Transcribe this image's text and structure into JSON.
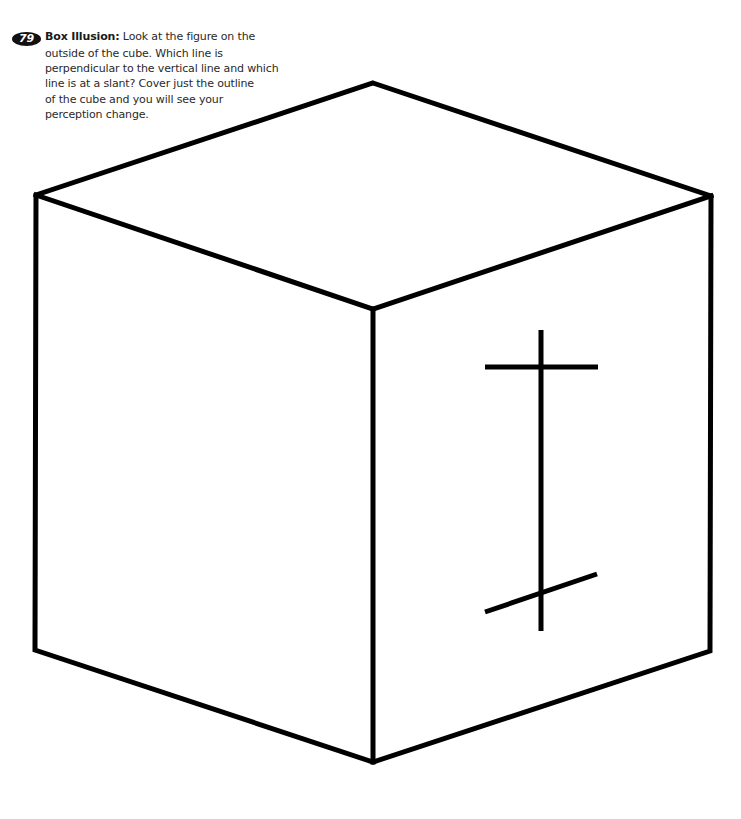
{
  "exercise": {
    "number": "79",
    "title": "Box Illusion:",
    "lines": [
      " Look at the figure on the",
      "outside of the cube. Which line is",
      "perpendicular to the vertical line and which",
      "line is at a slant? Cover just the outline",
      "of the cube and you will see your",
      "perception change."
    ]
  },
  "figure": {
    "stroke_color": "#000000",
    "cube_stroke_width": 5,
    "mark_stroke_width": 5
  }
}
